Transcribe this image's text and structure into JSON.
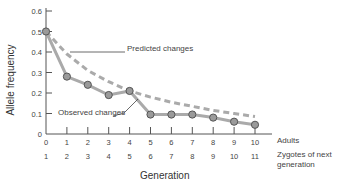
{
  "chart_data": {
    "type": "line",
    "title": "",
    "xlabel": "Generation",
    "ylabel": "Allele frequency",
    "x": [
      0,
      1,
      2,
      3,
      4,
      5,
      6,
      7,
      8,
      9,
      10
    ],
    "x_tick_labels_adults": [
      "0",
      "1",
      "2",
      "3",
      "4",
      "5",
      "6",
      "7",
      "8",
      "9",
      "10"
    ],
    "x_tick_labels_zygotes": [
      "1",
      "2",
      "3",
      "4",
      "5",
      "6",
      "7",
      "8",
      "9",
      "10",
      "11"
    ],
    "x_row_labels": {
      "adults": "Adults",
      "zygotes": "Zygotes of next generation"
    },
    "y_ticks": [
      "0",
      "0.1",
      "0.2",
      "0.3",
      "0.4",
      "0.5",
      "0.6"
    ],
    "ylim": [
      0,
      0.6
    ],
    "grid": false,
    "series": [
      {
        "name": "Observed changes",
        "style": "solid with circle markers",
        "values": [
          0.5,
          0.28,
          0.24,
          0.19,
          0.21,
          0.095,
          0.095,
          0.095,
          0.08,
          0.06,
          0.045
        ]
      },
      {
        "name": "Predicted changes",
        "style": "dashed",
        "values": [
          0.5,
          0.39,
          0.31,
          0.255,
          0.21,
          0.18,
          0.155,
          0.135,
          0.115,
          0.1,
          0.085
        ]
      }
    ],
    "annotations": [
      {
        "text": "Predicted changes",
        "points_to": "dashed curve near generation 0.5"
      },
      {
        "text": "Observed changes",
        "points_to": "solid line near generation 4.5"
      }
    ],
    "colors": {
      "observed_line": "#aaaaaa",
      "predicted_line": "#aaaaaa",
      "marker_fill": "#9a9a9a",
      "marker_edge": "#555555",
      "axis": "#555555"
    }
  },
  "labels": {
    "ylabel": "Allele frequency",
    "xlabel": "Generation",
    "adults": "Adults",
    "zygotes_line1": "Zygotes of next",
    "zygotes_line2": "generation",
    "predicted": "Predicted changes",
    "observed": "Observed changes"
  }
}
